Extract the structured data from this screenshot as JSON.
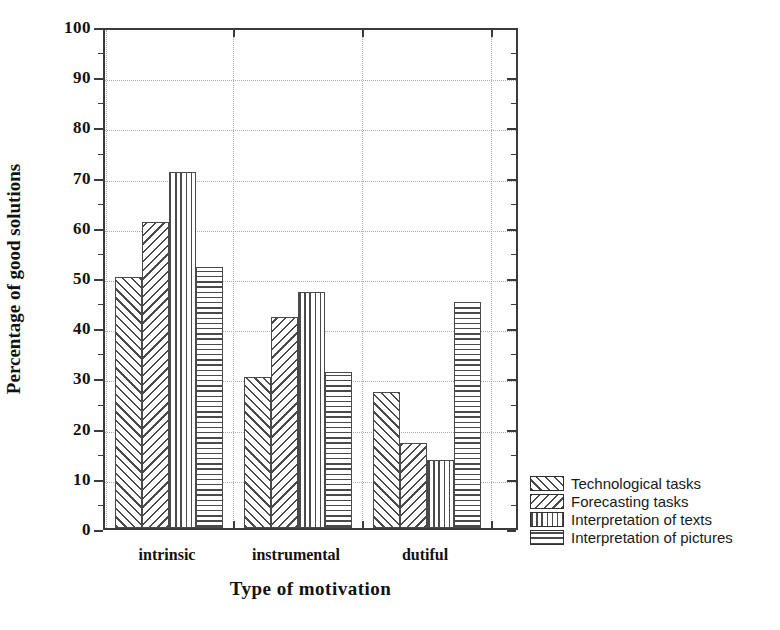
{
  "chart_data": {
    "type": "bar",
    "title": "",
    "xlabel": "Type of motivation",
    "ylabel": "Percentage of good solutions",
    "categories": [
      "intrinsic",
      "instrumental",
      "dutiful"
    ],
    "series": [
      {
        "name": "Technological tasks",
        "pattern": "diagonal-forward",
        "values": [
          50,
          30,
          27
        ]
      },
      {
        "name": "Forecasting tasks",
        "pattern": "diagonal-backward",
        "values": [
          61,
          42,
          17
        ]
      },
      {
        "name": "Interpretation of texts",
        "pattern": "vertical-lines",
        "values": [
          71,
          47,
          13.5
        ]
      },
      {
        "name": "Interpretation of pictures",
        "pattern": "horizontal-lines",
        "values": [
          52,
          31,
          45
        ]
      }
    ],
    "ylim": [
      0,
      100
    ],
    "ytick_step": 10,
    "yticks": [
      0,
      10,
      20,
      30,
      40,
      50,
      60,
      70,
      80,
      90,
      100
    ],
    "ytick_labels": [
      "0",
      "10",
      "20",
      "30",
      "40",
      "50",
      "60",
      "70",
      "80",
      "90",
      "100"
    ],
    "yminor_step": 5,
    "grid": true,
    "grid_style": "dotted",
    "legend_position": "right-bottom-outside",
    "colors": {
      "bar_edge": "#4a4a4a",
      "bar_fill": "#ffffff",
      "hatch": "#4a4a4a",
      "axis": "#3b3b3b",
      "grid": "#aeaeae",
      "text": "#111111"
    }
  },
  "legend": {
    "items": [
      {
        "label": "Technological tasks"
      },
      {
        "label": "Forecasting tasks"
      },
      {
        "label": "Interpretation of texts"
      },
      {
        "label": "Interpretation of pictures"
      }
    ]
  }
}
